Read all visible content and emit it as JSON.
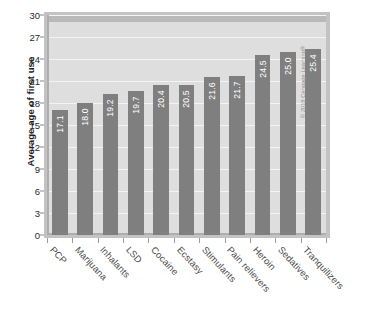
{
  "chart_data": {
    "type": "bar",
    "title": "",
    "xlabel": "",
    "ylabel": "Average age of first use",
    "ylim": [
      0,
      30
    ],
    "yticks": [
      0,
      3,
      6,
      9,
      12,
      15,
      18,
      21,
      24,
      27,
      30
    ],
    "grid": true,
    "legend": "none",
    "orientation": "vertical",
    "categories": [
      "PCP",
      "Marijuana",
      "Inhalants",
      "LSD",
      "Cocaine",
      "Ecstasy",
      "Stimulants",
      "Pain relievers",
      "Heroin",
      "Sedatives",
      "Tranquilizers"
    ],
    "values": [
      17.1,
      18.0,
      19.2,
      19.7,
      20.4,
      20.5,
      21.6,
      21.7,
      24.5,
      25.0,
      25.4
    ],
    "value_labels": [
      "17.1",
      "18.0",
      "19.2",
      "19.7",
      "20.4",
      "20.5",
      "21.6",
      "21.7",
      "24.5",
      "25.0",
      "25.4"
    ]
  },
  "colors": {
    "bar": "#7f7f7f",
    "plot_background": "#dedede",
    "gridline": "#f4f4f4",
    "frame": "#c3c3c3",
    "value_label": "#ffffff",
    "axis_text": "#2a2a2a"
  },
  "credit": {
    "text": "© 2018 Cengage Learning®"
  },
  "caption": {
    "text": ""
  }
}
